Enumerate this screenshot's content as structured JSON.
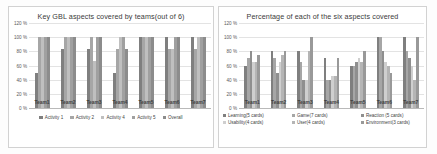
{
  "charts": [
    {
      "id": "left",
      "title": "Key GBL aspects covered by teams(out of 6)",
      "chart_data": {
        "type": "bar",
        "title": "Key GBL aspects covered by teams(out of 6)",
        "xlabel": "",
        "ylabel": "",
        "ylim": [
          0,
          120
        ],
        "ytick_labels": [
          "120 %",
          "100 %",
          "80 %",
          "60 %",
          "40 %",
          "20 %",
          "0 %"
        ],
        "ytick_values": [
          120,
          100,
          80,
          60,
          40,
          20,
          0
        ],
        "grid": true,
        "legend_position": "bottom",
        "categories": [
          "Team1",
          "Team2",
          "Team3",
          "Team4",
          "Team5",
          "Team6",
          "Team7"
        ],
        "series": [
          {
            "name": "Activity 1",
            "color": "#7f7f7f",
            "values": [
              50,
              83,
              83,
              50,
              100,
              100,
              100
            ]
          },
          {
            "name": "Activity 2",
            "color": "#a6a6a6",
            "values": [
              100,
              100,
              100,
              83,
              100,
              83,
              83
            ]
          },
          {
            "name": "Activity 4",
            "color": "#bfbfbf",
            "values": [
              100,
              100,
              67,
              100,
              100,
              83,
              100
            ]
          },
          {
            "name": "Activity 5",
            "color": "#a0a0a0",
            "values": [
              100,
              100,
              100,
              100,
              100,
              100,
              100
            ]
          },
          {
            "name": "Overall",
            "color": "#8c8c8c",
            "values": [
              100,
              100,
              100,
              83,
              100,
              100,
              100
            ]
          }
        ]
      }
    },
    {
      "id": "right",
      "title": "Percentage of each of the six aspects covered",
      "chart_data": {
        "type": "bar",
        "title": "Percentage of each of the six aspects covered",
        "xlabel": "",
        "ylabel": "",
        "ylim": [
          0,
          120
        ],
        "ytick_labels": [
          "120 %",
          "100 %",
          "80 %",
          "60 %",
          "40 %",
          "20 %",
          "0 %"
        ],
        "ytick_values": [
          120,
          100,
          80,
          60,
          40,
          20,
          0
        ],
        "grid": true,
        "legend_position": "bottom",
        "categories": [
          "Team1",
          "Team2",
          "Team3",
          "Team4",
          "Team5",
          "Team6",
          "Team7"
        ],
        "series": [
          {
            "name": "Learning(5 cards)",
            "color": "#7f7f7f",
            "values": [
              60,
              80,
              80,
              70,
              60,
              100,
              100
            ]
          },
          {
            "name": "Game(7 cards)",
            "color": "#a6a6a6",
            "values": [
              70,
              70,
              65,
              40,
              60,
              100,
              80
            ]
          },
          {
            "name": "Reaction (5 cards)",
            "color": "#8f8f8f",
            "values": [
              80,
              50,
              40,
              40,
              65,
              80,
              70
            ]
          },
          {
            "name": "Usability(4 cards)",
            "color": "#cfcfcf",
            "values": [
              65,
              65,
              40,
              45,
              70,
              65,
              60
            ]
          },
          {
            "name": "User(4 cards)",
            "color": "#b5b5b5",
            "values": [
              65,
              75,
              80,
              45,
              65,
              60,
              40
            ]
          },
          {
            "name": "Environment(3 cards)",
            "color": "#999999",
            "values": [
              75,
              80,
              100,
              70,
              80,
              50,
              100
            ]
          }
        ]
      }
    }
  ]
}
